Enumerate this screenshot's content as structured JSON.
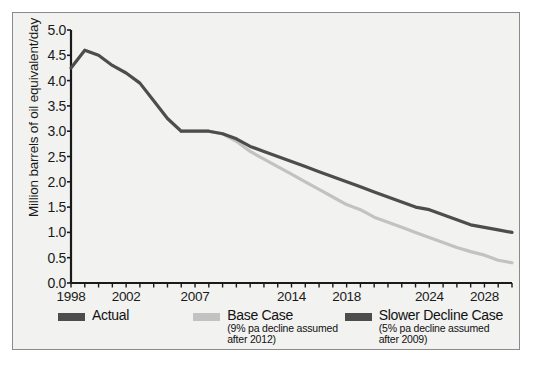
{
  "chart_data": {
    "type": "line",
    "title": "",
    "xlabel": "",
    "ylabel": "Million barrels of oil equivalent/day",
    "ylim": [
      0.0,
      5.0
    ],
    "ytick_labels": [
      "0.0",
      "0.5",
      "1.0",
      "1.5",
      "2.0",
      "2.5",
      "3.0",
      "3.5",
      "4.0",
      "4.5",
      "5.0"
    ],
    "ytick_values": [
      0.0,
      0.5,
      1.0,
      1.5,
      2.0,
      2.5,
      3.0,
      3.5,
      4.0,
      4.5,
      5.0
    ],
    "xlim": [
      1998,
      2030
    ],
    "xtick_labels": [
      "1998",
      "2002",
      "2007",
      "2014",
      "2018",
      "2024",
      "2028"
    ],
    "xtick_values": [
      1998,
      2002,
      2007,
      2014,
      2018,
      2024,
      2028
    ],
    "grid": false,
    "legend_position": "below",
    "series": [
      {
        "name": "Actual",
        "color": "#4d4d4d",
        "x": [
          1998,
          1999,
          2000,
          2001,
          2002,
          2003,
          2004,
          2005,
          2006
        ],
        "values": [
          4.25,
          4.6,
          4.5,
          4.3,
          4.15,
          3.95,
          3.6,
          3.25,
          3.0
        ]
      },
      {
        "name": "Base Case",
        "color": "#c2c2c2",
        "x": [
          2006,
          2007,
          2008,
          2009,
          2010,
          2011,
          2012,
          2013,
          2014,
          2015,
          2016,
          2017,
          2018,
          2019,
          2020,
          2021,
          2022,
          2023,
          2024,
          2025,
          2026,
          2027,
          2028,
          2029,
          2030
        ],
        "values": [
          3.0,
          3.0,
          3.0,
          2.95,
          2.8,
          2.6,
          2.45,
          2.3,
          2.15,
          2.0,
          1.85,
          1.7,
          1.55,
          1.45,
          1.3,
          1.2,
          1.1,
          1.0,
          0.9,
          0.8,
          0.7,
          0.62,
          0.55,
          0.45,
          0.4
        ]
      },
      {
        "name": "Slower Decline Case",
        "color": "#4d4d4d",
        "x": [
          2006,
          2007,
          2008,
          2009,
          2010,
          2011,
          2012,
          2013,
          2014,
          2015,
          2016,
          2017,
          2018,
          2019,
          2020,
          2021,
          2022,
          2023,
          2024,
          2025,
          2026,
          2027,
          2028,
          2029,
          2030
        ],
        "values": [
          3.0,
          3.0,
          3.0,
          2.95,
          2.85,
          2.7,
          2.6,
          2.5,
          2.4,
          2.3,
          2.2,
          2.1,
          2.0,
          1.9,
          1.8,
          1.7,
          1.6,
          1.5,
          1.45,
          1.35,
          1.25,
          1.15,
          1.1,
          1.05,
          1.0
        ]
      }
    ]
  },
  "legend": [
    {
      "label": "Actual",
      "sub_line1": "",
      "sub_line2": "",
      "color": "#4d4d4d"
    },
    {
      "label": "Base Case",
      "sub_line1": "(9% pa decline assumed",
      "sub_line2": "after 2012)",
      "color": "#c2c2c2"
    },
    {
      "label": "Slower Decline Case",
      "sub_line1": "(5% pa decline assumed",
      "sub_line2": "after 2009)",
      "color": "#4d4d4d"
    }
  ],
  "colors": {
    "dark_line": "#4d4d4d",
    "light_line": "#c2c2c2",
    "axis": "#1a1a1a",
    "background": "#f2f2f0",
    "border": "#8a8a8a"
  }
}
